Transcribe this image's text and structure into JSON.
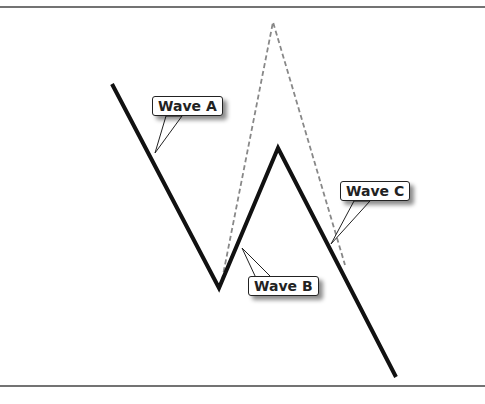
{
  "diagram": {
    "title": "",
    "frame_lines": {
      "top_y": 7,
      "bottom_y": 386
    },
    "colors": {
      "solid": "#111111",
      "dashed": "#888888",
      "callout_border": "#222222"
    },
    "solid_path": [
      [
        112,
        84
      ],
      [
        219,
        288
      ],
      [
        278,
        148
      ],
      [
        396,
        377
      ]
    ],
    "dashed_path": [
      [
        222,
        280
      ],
      [
        273,
        22
      ],
      [
        345,
        265
      ]
    ],
    "labels": [
      {
        "id": "wave-a",
        "text": "Wave A",
        "box": [
          152,
          96
        ],
        "pointer": [
          155,
          153
        ]
      },
      {
        "id": "wave-b",
        "text": "Wave B",
        "box": [
          248,
          276
        ],
        "pointer": [
          242,
          248
        ]
      },
      {
        "id": "wave-c",
        "text": "Wave C",
        "box": [
          340,
          181
        ],
        "pointer": [
          331,
          244
        ]
      }
    ]
  }
}
